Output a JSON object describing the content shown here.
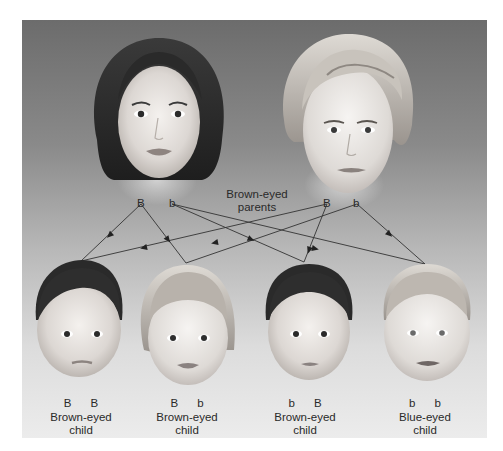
{
  "colors": {
    "panel_top": "#6c6c6c",
    "panel_bottom": "#ececec",
    "arrow_line": "#333333",
    "text": "#2a2a2a"
  },
  "parents": {
    "label_line1": "Brown-eyed",
    "label_line2": "parents",
    "mother": {
      "description": "Woman with dark bob hair",
      "alleles": [
        "B",
        "b"
      ]
    },
    "father": {
      "description": "Man with light swept hair",
      "alleles": [
        "B",
        "b"
      ]
    }
  },
  "children": [
    {
      "alleles": [
        "B",
        "B"
      ],
      "label_line1": "Brown-eyed",
      "label_line2": "child",
      "hair": "dark"
    },
    {
      "alleles": [
        "B",
        "b"
      ],
      "label_line1": "Brown-eyed",
      "label_line2": "child",
      "hair": "light bob"
    },
    {
      "alleles": [
        "b",
        "B"
      ],
      "label_line1": "Brown-eyed",
      "label_line2": "child",
      "hair": "dark"
    },
    {
      "alleles": [
        "b",
        "b"
      ],
      "label_line1": "Blue-eyed",
      "label_line2": "child",
      "hair": "light"
    }
  ],
  "arrows": [
    {
      "from": "mother.B",
      "to": "child1"
    },
    {
      "from": "mother.B",
      "to": "child2"
    },
    {
      "from": "mother.b",
      "to": "child3"
    },
    {
      "from": "mother.b",
      "to": "child4"
    },
    {
      "from": "father.B",
      "to": "child1"
    },
    {
      "from": "father.B",
      "to": "child3"
    },
    {
      "from": "father.b",
      "to": "child2"
    },
    {
      "from": "father.b",
      "to": "child4"
    }
  ]
}
